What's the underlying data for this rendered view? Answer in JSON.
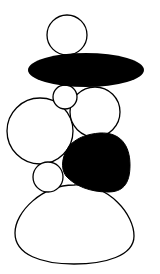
{
  "illustration": {
    "subject": "stacked-stones-cairn",
    "colors": {
      "background": "#ffffff",
      "fill_dark": "#000000",
      "fill_light": "#ffffff",
      "stroke": "#000000"
    },
    "shapes": [
      {
        "name": "top-stone",
        "type": "circle",
        "cx": 67,
        "cy": 35,
        "r": 20,
        "fill": "light"
      },
      {
        "name": "flat-black-stone",
        "type": "ellipse",
        "cx": 86,
        "cy": 70,
        "rx": 58,
        "ry": 17,
        "fill": "dark"
      },
      {
        "name": "small-pebble",
        "type": "circle",
        "cx": 65,
        "cy": 97,
        "r": 12,
        "fill": "light"
      },
      {
        "name": "medium-right-stone",
        "type": "circle",
        "cx": 95,
        "cy": 112,
        "r": 25,
        "fill": "light"
      },
      {
        "name": "large-left-stone",
        "type": "circle",
        "cx": 40,
        "cy": 131,
        "r": 33,
        "fill": "light"
      },
      {
        "name": "black-blob-stone",
        "type": "path",
        "fill": "dark"
      },
      {
        "name": "small-lower-pebble",
        "type": "circle",
        "cx": 48,
        "cy": 177,
        "r": 15,
        "fill": "light"
      },
      {
        "name": "base-dome-stone",
        "type": "path",
        "fill": "light"
      }
    ]
  }
}
